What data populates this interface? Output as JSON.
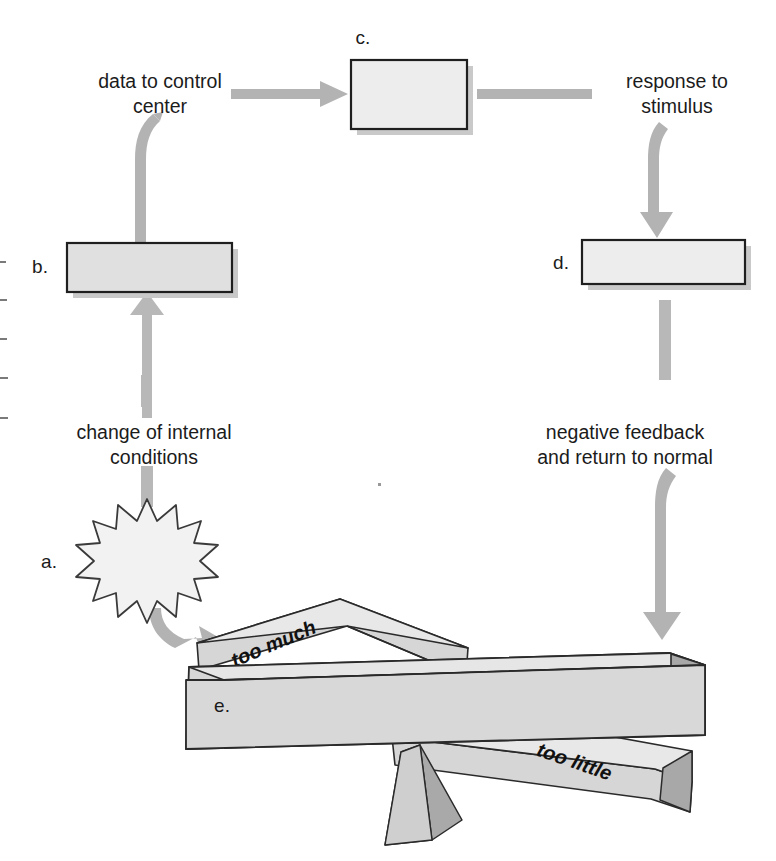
{
  "diagram": {
    "canvas": {
      "width": 776,
      "height": 861,
      "background": "#ffffff"
    },
    "colors": {
      "arrow": "#b3b3b3",
      "arrow_dark": "#a8a8a8",
      "box_fill": "#e8e8e8",
      "box_fill_light": "#efefef",
      "box_stroke": "#1f1f1f",
      "beam_top": "#e2e2e2",
      "beam_face": "#d8d8d8",
      "beam_side": "#b0b0b0",
      "shadow": "#c9c9c9",
      "text": "#1b1b1b",
      "star_fill": "#f2f2f2",
      "star_stroke": "#3a3a3a"
    },
    "boxes": [
      {
        "id": "b",
        "letter": "b.",
        "letter_x": 40,
        "letter_y": 268,
        "x": 67,
        "y": 243,
        "w": 165,
        "h": 49,
        "fill": "#e0e0e0"
      },
      {
        "id": "c",
        "letter": "c.",
        "letter_x": 363,
        "letter_y": 39,
        "x": 351,
        "y": 60,
        "w": 116,
        "h": 69,
        "fill": "#ededed"
      },
      {
        "id": "d",
        "letter": "d.",
        "letter_x": 561,
        "letter_y": 264,
        "x": 582,
        "y": 240,
        "w": 163,
        "h": 44,
        "fill": "#ededed"
      }
    ],
    "labels": [
      {
        "id": "data-to-control-center",
        "lines": [
          "data to control",
          "center"
        ],
        "x": 160,
        "y": 83,
        "line_height": 25
      },
      {
        "id": "response-to-stimulus",
        "lines": [
          "response to",
          "stimulus"
        ],
        "x": 677,
        "y": 83,
        "line_height": 25
      },
      {
        "id": "change-of-internal-conditions",
        "lines": [
          "change of internal",
          "conditions"
        ],
        "x": 154,
        "y": 434,
        "line_height": 25
      },
      {
        "id": "negative-feedback",
        "lines": [
          "negative feedback",
          "and return to normal"
        ],
        "x": 625,
        "y": 434,
        "line_height": 25
      }
    ],
    "star": {
      "id": "a",
      "letter": "a.",
      "letter_x": 49,
      "letter_y": 563,
      "cx": 147,
      "cy": 561,
      "outer_r": 62,
      "inner_r": 41,
      "points": 16
    },
    "beams": [
      {
        "id": "too-much",
        "label": "too much",
        "label_x": 274,
        "label_y": 645,
        "rotation": -23
      },
      {
        "id": "fulcrum-beam",
        "label": "e.",
        "label_x": 222,
        "label_y": 707,
        "rotation": 0
      },
      {
        "id": "too-little",
        "label": "too little",
        "label_x": 574,
        "label_y": 763,
        "rotation": 19
      }
    ],
    "arrows": [
      {
        "id": "b-to-text",
        "kind": "curve-up",
        "from": "box-b",
        "to": "data-to-control-center"
      },
      {
        "id": "text-to-c",
        "kind": "straight-right",
        "from": "data-to-control-center",
        "to": "box-c"
      },
      {
        "id": "c-to-text",
        "kind": "straight-right-plain",
        "from": "box-c",
        "to": "response-to-stimulus"
      },
      {
        "id": "text-to-d",
        "kind": "curve-down",
        "from": "response-to-stimulus",
        "to": "box-d"
      },
      {
        "id": "stub-to-b",
        "kind": "arrow-up",
        "from": "change-of-internal-conditions",
        "to": "box-b"
      },
      {
        "id": "d-to-text",
        "kind": "stub-down",
        "from": "box-d",
        "to": "negative-feedback"
      },
      {
        "id": "text-to-star",
        "kind": "stub-down",
        "from": "change-of-internal-conditions",
        "to": "star-a"
      },
      {
        "id": "star-to-beam",
        "kind": "curve-down-right",
        "from": "star-a",
        "to": "too-much-beam"
      },
      {
        "id": "feedback-to-beam",
        "kind": "long-curve-down",
        "from": "negative-feedback",
        "to": "balance-beam"
      }
    ]
  }
}
